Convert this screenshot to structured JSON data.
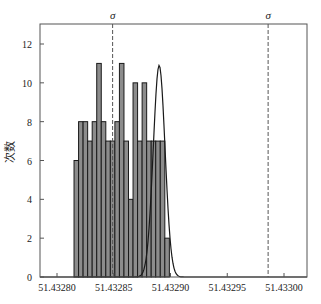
{
  "chart_data": {
    "type": "bar",
    "title": "",
    "xlabel": "",
    "ylabel": "次数",
    "ylim": [
      0,
      13
    ],
    "xlim": [
      51.432775,
      51.433015
    ],
    "yticks": [
      0,
      2,
      4,
      6,
      8,
      10,
      12
    ],
    "xticks": [
      51.4328,
      51.43285,
      51.4329,
      51.43295,
      51.433
    ],
    "xtick_labels": [
      "51.43280",
      "51.43285",
      "51.43290",
      "51.43295",
      "51.43300"
    ],
    "bin_start": 51.432815,
    "bin_width": 4e-06,
    "counts": [
      6,
      8,
      8,
      7,
      8,
      11,
      8,
      7,
      7,
      8,
      11,
      7,
      4,
      10,
      7,
      10,
      7,
      7,
      7,
      7,
      2
    ],
    "normal_curve": {
      "mean": 51.43289,
      "peak": 10.9,
      "sd": 5.2e-06
    },
    "sigma_lines": [
      {
        "label": "σ",
        "x": 51.432849
      },
      {
        "label": "σ",
        "x": 51.432986
      }
    ],
    "grid": false,
    "legend": "none",
    "colors": {
      "bar_fill": "#8c8c8c",
      "bar_edge": "#1a1a1a",
      "curve": "#1a1a1a",
      "axis": "#444444"
    }
  }
}
